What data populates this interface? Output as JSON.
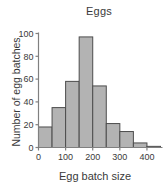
{
  "chart_data": {
    "type": "bar",
    "title": "Eggs",
    "xlabel": "Egg batch size",
    "ylabel": "Number of egg batches",
    "categories": [
      "0-50",
      "50-100",
      "100-150",
      "150-200",
      "200-250",
      "250-300",
      "300-350",
      "350-400",
      "400-450"
    ],
    "bin_edges": [
      0,
      50,
      100,
      150,
      200,
      250,
      300,
      350,
      400,
      450
    ],
    "values": [
      18,
      35,
      58,
      97,
      54,
      21,
      14,
      4,
      1
    ],
    "x": [
      25,
      75,
      125,
      175,
      225,
      275,
      325,
      375,
      425
    ],
    "xlim": [
      0,
      450
    ],
    "ylim": [
      0,
      100
    ],
    "xticks": [
      0,
      100,
      200,
      300,
      400
    ],
    "xtick_labels": [
      "0",
      "100",
      "200",
      "300",
      "400"
    ],
    "yticks": [
      0,
      20,
      40,
      60,
      80,
      100
    ],
    "ytick_labels": [
      "0",
      "20",
      "40",
      "60",
      "80",
      "100"
    ],
    "grid": false,
    "legend": false,
    "bar_fill_color": "#b3b3b3",
    "bar_edge_color": "#4d4d4d",
    "axis_color": "#808080",
    "text_color": "#3a3a3a",
    "background_color": "#ffffff"
  }
}
